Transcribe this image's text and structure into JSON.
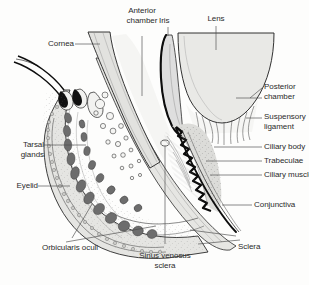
{
  "figure": {
    "background_color": "#fdfdfc",
    "line_color": "#1a1a1a",
    "tissue_fill": "#e3e3e0",
    "lens_fill": "#e9e9e6",
    "gland_fill": "#6f6f6f",
    "stipple_color": "#555555"
  },
  "labels": {
    "anterior_chamber": {
      "line1": "Anterior",
      "line2": "chamber"
    },
    "iris": {
      "line1": "Iris"
    },
    "lens": {
      "line1": "Lens"
    },
    "cornea": {
      "line1": "Cornea"
    },
    "posterior_chamber": {
      "line1": "Posterior",
      "line2": "chamber"
    },
    "suspensory_ligament": {
      "line1": "Suspensory",
      "line2": "ligament"
    },
    "ciliary_body": {
      "line1": "Ciliary body"
    },
    "trabeculae": {
      "line1": "Trabeculae"
    },
    "ciliary_muscle": {
      "line1": "Ciliary muscle"
    },
    "conjunctiva": {
      "line1": "Conjunctiva"
    },
    "sclera": {
      "line1": "Sclera"
    },
    "tarsal_glands": {
      "line1": "Tarsal",
      "line2": "glands"
    },
    "eyelid": {
      "line1": "Eyelid"
    },
    "orbicularis_oculi": {
      "line1": "Orbicularis oculi"
    },
    "sinus_venosus_sclera": {
      "line1": "Sinus venosus",
      "line2": "sclera"
    }
  },
  "structures": [
    {
      "name": "cornea",
      "label": "Cornea"
    },
    {
      "name": "anterior-chamber",
      "label": "Anterior chamber"
    },
    {
      "name": "iris",
      "label": "Iris"
    },
    {
      "name": "lens",
      "label": "Lens"
    },
    {
      "name": "posterior-chamber",
      "label": "Posterior chamber"
    },
    {
      "name": "suspensory-ligament",
      "label": "Suspensory ligament"
    },
    {
      "name": "ciliary-body",
      "label": "Ciliary body"
    },
    {
      "name": "trabeculae",
      "label": "Trabeculae"
    },
    {
      "name": "ciliary-muscle",
      "label": "Ciliary muscle"
    },
    {
      "name": "conjunctiva",
      "label": "Conjunctiva"
    },
    {
      "name": "sclera",
      "label": "Sclera"
    },
    {
      "name": "tarsal-glands",
      "label": "Tarsal glands"
    },
    {
      "name": "eyelid",
      "label": "Eyelid"
    },
    {
      "name": "orbicularis-oculi",
      "label": "Orbicularis oculi"
    },
    {
      "name": "sinus-venosus-sclera",
      "label": "Sinus venosus sclera"
    }
  ]
}
